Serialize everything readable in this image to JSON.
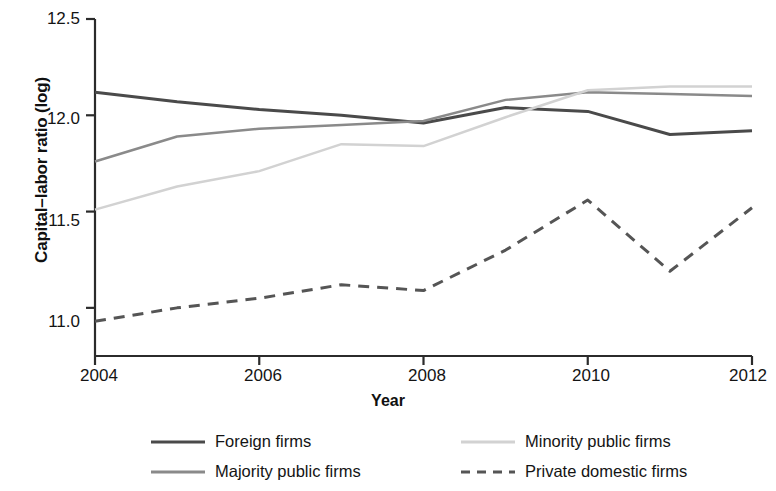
{
  "chart_data": {
    "type": "line",
    "title": "",
    "xlabel": "Year",
    "ylabel": "Capital–labor ratio (log)",
    "x": [
      2004,
      2005,
      2006,
      2007,
      2008,
      2009,
      2010,
      2011,
      2012
    ],
    "xlim": [
      2004,
      2012
    ],
    "ylim": [
      10.75,
      12.5
    ],
    "xticks": [
      2004,
      2006,
      2008,
      2010,
      2012
    ],
    "xtick_labels": [
      "2004",
      "2006",
      "2008",
      "2010",
      "2012"
    ],
    "yticks": [
      11.0,
      11.5,
      12.0,
      12.5
    ],
    "ytick_labels": [
      "11.0",
      "11.5",
      "12.0",
      "12.5"
    ],
    "grid": false,
    "legend_position": "below",
    "series": [
      {
        "name": "Foreign firms",
        "style": "solid",
        "color": "#4a4a4a",
        "width": 3,
        "values": [
          12.12,
          12.07,
          12.03,
          12.0,
          11.96,
          12.04,
          12.02,
          11.9,
          11.92
        ]
      },
      {
        "name": "Majority public firms",
        "style": "solid",
        "color": "#8a8a8a",
        "width": 2.5,
        "values": [
          11.76,
          11.89,
          11.93,
          11.95,
          11.97,
          12.08,
          12.12,
          12.11,
          12.1
        ]
      },
      {
        "name": "Minority public firms",
        "style": "solid",
        "color": "#d2d2d2",
        "width": 2.5,
        "values": [
          11.51,
          11.63,
          11.71,
          11.85,
          11.84,
          11.99,
          12.13,
          12.15,
          12.15
        ]
      },
      {
        "name": "Private domestic firms",
        "style": "dashed",
        "color": "#555555",
        "width": 3,
        "values": [
          10.93,
          11.0,
          11.05,
          11.12,
          11.09,
          11.3,
          11.56,
          11.19,
          11.52
        ]
      }
    ]
  },
  "legend": {
    "items": [
      {
        "label": "Foreign firms",
        "key": "foreign-firms"
      },
      {
        "label": "Minority public firms",
        "key": "minority-public-firms"
      },
      {
        "label": "Majority public firms",
        "key": "majority-public-firms"
      },
      {
        "label": "Private domestic firms",
        "key": "private-domestic-firms"
      }
    ]
  }
}
